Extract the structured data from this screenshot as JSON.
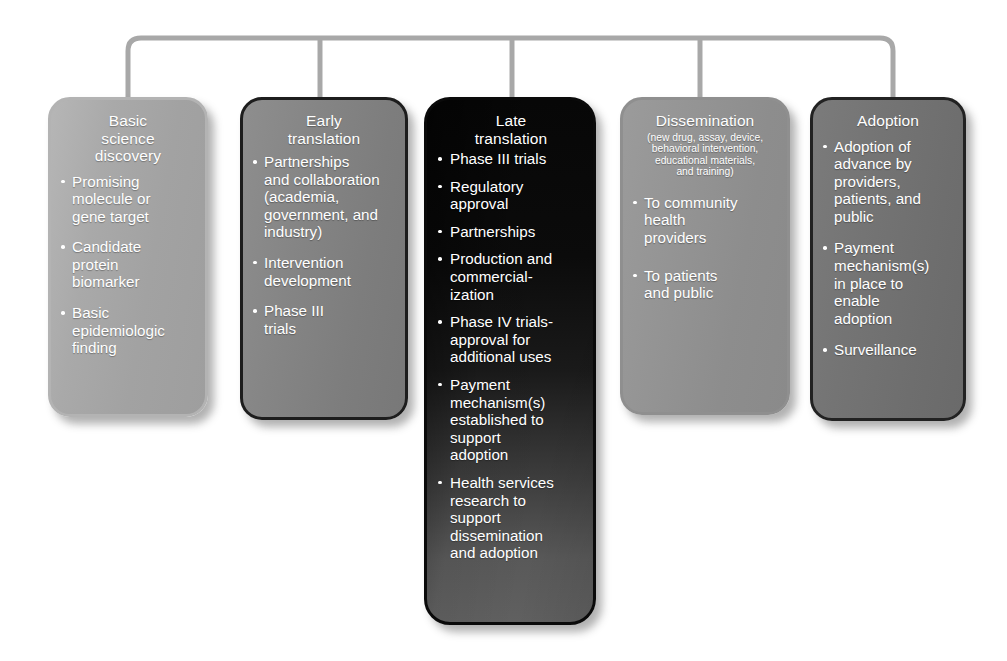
{
  "diagram": {
    "connector": {
      "name": "bracket-connector",
      "color": "#a8a8a8"
    },
    "stages": [
      {
        "id": "basic",
        "title": "Basic\nscience\ndiscovery",
        "title_lines": [
          "Basic",
          "science",
          "discovery"
        ],
        "subtitle": "",
        "bullets": [
          "Promising\nmolecule or\ngene target",
          "Candidate\nprotein\nbiomarker",
          "Basic\nepidemiologic\nfinding"
        ]
      },
      {
        "id": "early",
        "title": "Early\ntranslation",
        "title_lines": [
          "Early",
          "translation"
        ],
        "subtitle": "",
        "bullets": [
          "Partnerships\nand collaboration\n(academia,\ngovernment, and\nindustry)",
          "Intervention\ndevelopment",
          "Phase III\ntrials"
        ]
      },
      {
        "id": "late",
        "title": "Late\ntranslation",
        "title_lines": [
          "Late",
          "translation"
        ],
        "subtitle": "",
        "bullets": [
          "Phase III trials",
          "Regulatory\napproval",
          "Partnerships",
          "Production and\ncommercial-\nization",
          "Phase IV trials-\napproval for\nadditional uses",
          "Payment\nmechanism(s)\nestablished to\nsupport\nadoption",
          "Health services\nresearch to\nsupport\ndissemination\nand adoption"
        ]
      },
      {
        "id": "dissemination",
        "title": "Dissemination",
        "title_lines": [
          "Dissemination"
        ],
        "subtitle": "(new drug, assay, device,\nbehavioral intervention,\neducational materials,\nand training)",
        "bullets": [
          "To community\nhealth\nproviders",
          "To patients\nand public"
        ]
      },
      {
        "id": "adoption",
        "title": "Adoption",
        "title_lines": [
          "Adoption"
        ],
        "subtitle": "",
        "bullets": [
          "Adoption of\nadvance by\nproviders,\npatients, and\npublic",
          "Payment\nmechanism(s)\nin place to\nenable\nadoption",
          "Surveillance"
        ]
      }
    ]
  }
}
